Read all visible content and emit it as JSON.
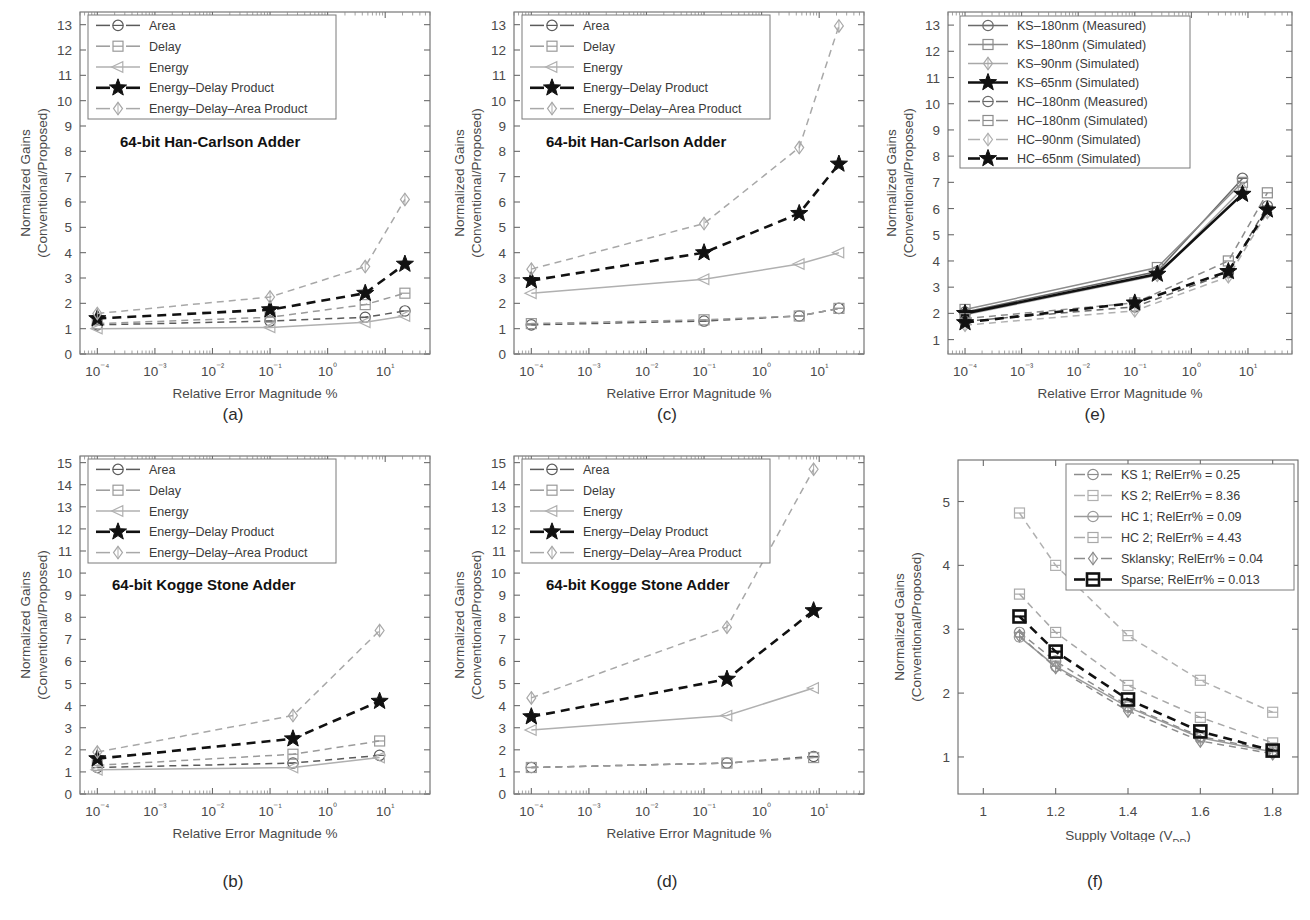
{
  "figure": {
    "width": 1310,
    "height": 920,
    "background": "#ffffff"
  },
  "common": {
    "ylabel_line1": "Normalized Gains",
    "ylabel_line2": "(Conventional/Proposed)",
    "xlabel_error": "Relative Error Magnitude %",
    "xlabel_voltage_main": "Supply Voltage (V",
    "xlabel_voltage_sub": "DD",
    "xlabel_voltage_tail": ")",
    "colors": {
      "black": "#111111",
      "dark_gray": "#4d4d4d",
      "mid_gray": "#8c8c8c",
      "light_gray": "#b0b0b0",
      "axis": "#6b6b6b",
      "text": "#3a3a3a"
    }
  },
  "panels": [
    {
      "id": "a",
      "caption": "(a)",
      "annotation": "64-bit Han-Carlson Adder",
      "xlabel": "Relative Error Magnitude %",
      "xtick_labels": [
        "10⁻⁴",
        "10⁻³",
        "10⁻²",
        "10⁻¹",
        "10⁰",
        "10¹"
      ],
      "ytick_labels": [
        "0",
        "1",
        "2",
        "3",
        "4",
        "5",
        "6",
        "7",
        "8",
        "9",
        "10",
        "11",
        "12",
        "13"
      ]
    },
    {
      "id": "b",
      "caption": "(b)",
      "annotation": "64-bit Kogge Stone Adder",
      "xlabel": "Relative Error Magnitude %",
      "xtick_labels": [
        "10⁻⁴",
        "10⁻³",
        "10⁻²",
        "10⁻¹",
        "10⁰",
        "10¹"
      ],
      "ytick_labels": [
        "0",
        "1",
        "2",
        "3",
        "4",
        "5",
        "6",
        "7",
        "8",
        "9",
        "10",
        "11",
        "12",
        "13",
        "14",
        "15"
      ]
    },
    {
      "id": "c",
      "caption": "(c)",
      "annotation": "64-bit Han-Carlson Adder",
      "xlabel": "Relative Error Magnitude %",
      "xtick_labels": [
        "10⁻⁴",
        "10⁻³",
        "10⁻²",
        "10⁻¹",
        "10⁰",
        "10¹"
      ],
      "ytick_labels": [
        "0",
        "1",
        "2",
        "3",
        "4",
        "5",
        "6",
        "7",
        "8",
        "9",
        "10",
        "11",
        "12",
        "13"
      ]
    },
    {
      "id": "d",
      "caption": "(d)",
      "annotation": "64-bit Kogge Stone Adder",
      "xlabel": "Relative Error Magnitude %",
      "xtick_labels": [
        "10⁻⁴",
        "10⁻³",
        "10⁻²",
        "10⁻¹",
        "10⁰",
        "10¹"
      ],
      "ytick_labels": [
        "0",
        "1",
        "2",
        "3",
        "4",
        "5",
        "6",
        "7",
        "8",
        "9",
        "10",
        "11",
        "12",
        "13",
        "14",
        "15"
      ]
    },
    {
      "id": "e",
      "caption": "(e)",
      "annotation": "",
      "xlabel": "Relative Error Magnitude %",
      "xtick_labels": [
        "10⁻⁴",
        "10⁻³",
        "10⁻²",
        "10⁻¹",
        "10⁰",
        "10¹"
      ],
      "ytick_labels": [
        "1",
        "2",
        "3",
        "4",
        "5",
        "6",
        "7",
        "8",
        "9",
        "10",
        "11",
        "12",
        "13"
      ]
    },
    {
      "id": "f",
      "caption": "(f)",
      "annotation": "",
      "xlabel": "Supply Voltage (VDD)",
      "xtick_labels": [
        "1",
        "1.2",
        "1.4",
        "1.6",
        "1.8"
      ],
      "ytick_labels": [
        "1",
        "2",
        "3",
        "4",
        "5"
      ]
    }
  ],
  "chart_data": [
    {
      "id": "a",
      "type": "line",
      "title": "64-bit Han-Carlson Adder",
      "xlabel": "Relative Error Magnitude %",
      "ylabel": "Normalized Gains (Conventional/Proposed)",
      "xscale": "log",
      "xlim": [
        5e-05,
        60
      ],
      "ylim": [
        0,
        13.5
      ],
      "ytick_values": [
        0,
        1,
        2,
        3,
        4,
        5,
        6,
        7,
        8,
        9,
        10,
        11,
        12,
        13
      ],
      "xtick_values": [
        0.0001,
        0.001,
        0.01,
        0.1,
        1,
        10
      ],
      "grid": false,
      "legend_position": "top-left",
      "x": [
        0.0001,
        0.1,
        4.5,
        22
      ],
      "series": [
        {
          "name": "Area",
          "marker": "circle-dash",
          "style": "dashed",
          "color": "#5a5a5a",
          "values": [
            1.15,
            1.3,
            1.45,
            1.7
          ]
        },
        {
          "name": "Delay",
          "marker": "square",
          "style": "dashed",
          "color": "#9a9a9a",
          "values": [
            1.2,
            1.45,
            1.95,
            2.4
          ]
        },
        {
          "name": "Energy",
          "marker": "triangle-left",
          "style": "solid",
          "color": "#b0b0b0",
          "values": [
            1.0,
            1.05,
            1.25,
            1.5
          ]
        },
        {
          "name": "Energy–Delay Product",
          "marker": "star",
          "style": "dashed-bold",
          "color": "#111111",
          "values": [
            1.4,
            1.75,
            2.4,
            3.55
          ]
        },
        {
          "name": "Energy–Delay–Area Product",
          "marker": "diamond",
          "style": "dashed",
          "color": "#a8a8a8",
          "values": [
            1.6,
            2.25,
            3.45,
            6.1
          ]
        }
      ]
    },
    {
      "id": "b",
      "type": "line",
      "title": "64-bit Kogge Stone Adder",
      "xlabel": "Relative Error Magnitude %",
      "ylabel": "Normalized Gains (Conventional/Proposed)",
      "xscale": "log",
      "xlim": [
        5e-05,
        60
      ],
      "ylim": [
        0,
        15.3
      ],
      "ytick_values": [
        0,
        1,
        2,
        3,
        4,
        5,
        6,
        7,
        8,
        9,
        10,
        11,
        12,
        13,
        14,
        15
      ],
      "xtick_values": [
        0.0001,
        0.001,
        0.01,
        0.1,
        1,
        10
      ],
      "grid": false,
      "legend_position": "top-left",
      "x": [
        0.0001,
        0.25,
        8
      ],
      "series": [
        {
          "name": "Area",
          "marker": "circle-dash",
          "style": "dashed",
          "color": "#5a5a5a",
          "values": [
            1.2,
            1.4,
            1.75
          ]
        },
        {
          "name": "Delay",
          "marker": "square",
          "style": "dashed",
          "color": "#9a9a9a",
          "values": [
            1.3,
            1.8,
            2.4
          ]
        },
        {
          "name": "Energy",
          "marker": "triangle-left",
          "style": "solid",
          "color": "#b0b0b0",
          "values": [
            1.1,
            1.2,
            1.65
          ]
        },
        {
          "name": "Energy–Delay Product",
          "marker": "star",
          "style": "dashed-bold",
          "color": "#111111",
          "values": [
            1.6,
            2.5,
            4.2
          ]
        },
        {
          "name": "Energy–Delay–Area Product",
          "marker": "diamond",
          "style": "dashed",
          "color": "#a8a8a8",
          "values": [
            1.9,
            3.55,
            7.4
          ]
        }
      ]
    },
    {
      "id": "c",
      "type": "line",
      "title": "64-bit Han-Carlson Adder",
      "xlabel": "Relative Error Magnitude %",
      "ylabel": "Normalized Gains (Conventional/Proposed)",
      "xscale": "log",
      "xlim": [
        5e-05,
        60
      ],
      "ylim": [
        0,
        13.5
      ],
      "ytick_values": [
        0,
        1,
        2,
        3,
        4,
        5,
        6,
        7,
        8,
        9,
        10,
        11,
        12,
        13
      ],
      "xtick_values": [
        0.0001,
        0.001,
        0.01,
        0.1,
        1,
        10
      ],
      "grid": false,
      "legend_position": "top-left",
      "x": [
        0.0001,
        0.1,
        4.5,
        22
      ],
      "series": [
        {
          "name": "Area",
          "marker": "circle-dash",
          "style": "dashed",
          "color": "#5a5a5a",
          "values": [
            1.15,
            1.3,
            1.5,
            1.8
          ]
        },
        {
          "name": "Delay",
          "marker": "square",
          "style": "dashed",
          "color": "#9a9a9a",
          "values": [
            1.2,
            1.35,
            1.5,
            1.8
          ]
        },
        {
          "name": "Energy",
          "marker": "triangle-left",
          "style": "solid",
          "color": "#b0b0b0",
          "values": [
            2.4,
            2.95,
            3.55,
            4.0
          ]
        },
        {
          "name": "Energy–Delay Product",
          "marker": "star",
          "style": "dashed-bold",
          "color": "#111111",
          "values": [
            2.9,
            4.0,
            5.55,
            7.5
          ]
        },
        {
          "name": "Energy–Delay–Area Product",
          "marker": "diamond",
          "style": "dashed",
          "color": "#a8a8a8",
          "values": [
            3.35,
            5.15,
            8.15,
            12.95
          ]
        }
      ]
    },
    {
      "id": "d",
      "type": "line",
      "title": "64-bit Kogge Stone Adder",
      "xlabel": "Relative Error Magnitude %",
      "ylabel": "Normalized Gains (Conventional/Proposed)",
      "xscale": "log",
      "xlim": [
        5e-05,
        60
      ],
      "ylim": [
        0,
        15.3
      ],
      "ytick_values": [
        0,
        1,
        2,
        3,
        4,
        5,
        6,
        7,
        8,
        9,
        10,
        11,
        12,
        13,
        14,
        15
      ],
      "xtick_values": [
        0.0001,
        0.001,
        0.01,
        0.1,
        1,
        10
      ],
      "grid": false,
      "legend_position": "top-left",
      "x": [
        0.0001,
        0.25,
        8
      ],
      "series": [
        {
          "name": "Area",
          "marker": "circle-dash",
          "style": "dashed",
          "color": "#5a5a5a",
          "values": [
            1.2,
            1.4,
            1.7
          ]
        },
        {
          "name": "Delay",
          "marker": "square",
          "style": "dashed",
          "color": "#9a9a9a",
          "values": [
            1.2,
            1.4,
            1.65
          ]
        },
        {
          "name": "Energy",
          "marker": "triangle-left",
          "style": "solid",
          "color": "#b0b0b0",
          "values": [
            2.9,
            3.55,
            4.8
          ]
        },
        {
          "name": "Energy–Delay Product",
          "marker": "star",
          "style": "dashed-bold",
          "color": "#111111",
          "values": [
            3.5,
            5.2,
            8.3
          ]
        },
        {
          "name": "Energy–Delay–Area Product",
          "marker": "diamond",
          "style": "dashed",
          "color": "#a8a8a8",
          "values": [
            4.35,
            7.55,
            14.7
          ]
        }
      ]
    },
    {
      "id": "e",
      "type": "line",
      "title": "",
      "xlabel": "Relative Error Magnitude %",
      "ylabel": "Normalized Gains (Conventional/Proposed)",
      "xscale": "log",
      "xlim": [
        5e-05,
        60
      ],
      "ylim": [
        0.45,
        13.5
      ],
      "ytick_values": [
        1,
        2,
        3,
        4,
        5,
        6,
        7,
        8,
        9,
        10,
        11,
        12,
        13
      ],
      "xtick_values": [
        0.0001,
        0.001,
        0.01,
        0.1,
        1,
        10
      ],
      "grid": false,
      "legend_position": "top-left",
      "x_ks": [
        0.0001,
        0.25,
        8
      ],
      "x_hc": [
        0.0001,
        0.1,
        4.5,
        22
      ],
      "series": [
        {
          "name": "KS–180nm (Measured)",
          "marker": "circle-dash",
          "style": "solid",
          "color": "#6a6a6a",
          "x_set": "ks",
          "values": [
            2.05,
            3.6,
            7.15
          ]
        },
        {
          "name": "KS–180nm (Simulated)",
          "marker": "square",
          "style": "solid",
          "color": "#8c8c8c",
          "x_set": "ks",
          "values": [
            2.15,
            3.75,
            7.0
          ]
        },
        {
          "name": "KS–90nm (Simulated)",
          "marker": "diamond",
          "style": "solid",
          "color": "#a8a8a8",
          "x_set": "ks",
          "values": [
            1.95,
            3.45,
            6.75
          ]
        },
        {
          "name": "KS–65nm (Simulated)",
          "marker": "star",
          "style": "solid-bold",
          "color": "#111111",
          "x_set": "ks",
          "values": [
            2.0,
            3.5,
            6.55
          ]
        },
        {
          "name": "HC–180nm (Measured)",
          "marker": "circle-dash",
          "style": "dashed",
          "color": "#6a6a6a",
          "x_set": "hc",
          "values": [
            1.7,
            2.25,
            3.55,
            6.1
          ]
        },
        {
          "name": "HC–180nm (Simulated)",
          "marker": "square",
          "style": "dashed",
          "color": "#8c8c8c",
          "x_set": "hc",
          "values": [
            1.8,
            2.4,
            4.0,
            6.6
          ]
        },
        {
          "name": "HC–90nm (Simulated)",
          "marker": "diamond",
          "style": "dashed",
          "color": "#b0b0b0",
          "x_set": "hc",
          "values": [
            1.55,
            2.1,
            3.4,
            5.85
          ]
        },
        {
          "name": "HC–65nm (Simulated)",
          "marker": "star",
          "style": "dashed-bold",
          "color": "#111111",
          "x_set": "hc",
          "values": [
            1.65,
            2.4,
            3.6,
            5.95
          ]
        }
      ]
    },
    {
      "id": "f",
      "type": "line",
      "title": "",
      "xlabel": "Supply Voltage (VDD)",
      "ylabel": "Normalized Gains (Conventional/Proposed)",
      "xscale": "linear",
      "xlim": [
        0.93,
        1.87
      ],
      "ylim": [
        0.42,
        5.65
      ],
      "ytick_values": [
        1,
        2,
        3,
        4,
        5
      ],
      "xtick_values": [
        1,
        1.2,
        1.4,
        1.6,
        1.8
      ],
      "grid": false,
      "legend_position": "top-right",
      "x": [
        1.1,
        1.2,
        1.4,
        1.6,
        1.8
      ],
      "series": [
        {
          "name": "KS 1; RelErr% = 0.25",
          "marker": "circle-dash",
          "style": "dashed",
          "color": "#8c8c8c",
          "values": [
            2.95,
            2.5,
            1.8,
            1.32,
            1.1
          ]
        },
        {
          "name": "KS 2; RelErr% = 8.36",
          "marker": "square",
          "style": "dashed",
          "color": "#b0b0b0",
          "values": [
            4.82,
            4.0,
            2.9,
            2.2,
            1.7
          ]
        },
        {
          "name": "HC 1; RelErr% = 0.09",
          "marker": "circle-dash",
          "style": "solid",
          "color": "#9a9a9a",
          "values": [
            2.88,
            2.42,
            1.78,
            1.3,
            1.08
          ]
        },
        {
          "name": "HC 2; RelErr% = 4.43",
          "marker": "square",
          "style": "dashed",
          "color": "#a8a8a8",
          "values": [
            3.55,
            2.95,
            2.12,
            1.62,
            1.22
          ]
        },
        {
          "name": "Sklansky; RelErr% = 0.04",
          "marker": "diamond",
          "style": "dashed",
          "color": "#8c8c8c",
          "values": [
            2.9,
            2.4,
            1.72,
            1.25,
            1.05
          ]
        },
        {
          "name": "Sparse; RelErr% = 0.013",
          "marker": "square-bold",
          "style": "dashed-bold",
          "color": "#111111",
          "values": [
            3.2,
            2.65,
            1.9,
            1.4,
            1.1
          ]
        }
      ]
    }
  ],
  "legends": {
    "abcd": [
      "Area",
      "Delay",
      "Energy",
      "Energy–Delay Product",
      "Energy–Delay–Area Product"
    ],
    "e": [
      "KS–180nm (Measured)",
      "KS–180nm (Simulated)",
      "KS–90nm (Simulated)",
      "KS–65nm (Simulated)",
      "HC–180nm (Measured)",
      "HC–180nm (Simulated)",
      "HC–90nm (Simulated)",
      "HC–65nm (Simulated)"
    ],
    "f": [
      "KS 1; RelErr% = 0.25",
      "KS 2; RelErr% = 8.36",
      "HC 1; RelErr% = 0.09",
      "HC 2; RelErr% = 4.43",
      "Sklansky; RelErr% = 0.04",
      "Sparse; RelErr% = 0.013"
    ]
  }
}
